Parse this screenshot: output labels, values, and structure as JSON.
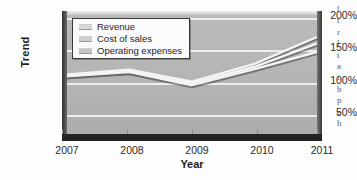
{
  "chart_data": {
    "type": "line",
    "title": "",
    "xlabel": "Year",
    "ylabel": "Trend",
    "categories": [
      "2007",
      "2008",
      "2009",
      "2010",
      "2011"
    ],
    "x": [
      2007,
      2008,
      2009,
      2010,
      2011
    ],
    "ylim": [
      0,
      200
    ],
    "xlim": [
      2007,
      2011
    ],
    "yticks": [
      "50%",
      "100%",
      "150%",
      "200%"
    ],
    "ytick_values": [
      50,
      100,
      150,
      200
    ],
    "grid": true,
    "legend_position": "top-left",
    "series": [
      {
        "name": "Revenue",
        "values": [
          100,
          108,
          88,
          118,
          163
        ]
      },
      {
        "name": "Cost of sales",
        "values": [
          99,
          106,
          85,
          113,
          152
        ]
      },
      {
        "name": "Operating expenses",
        "values": [
          97,
          104,
          82,
          109,
          138
        ]
      }
    ]
  },
  "axes": {
    "y_title": "Trend",
    "x_title": "Year",
    "y_ticks": [
      {
        "label": "200%",
        "value": 200
      },
      {
        "label": "150%",
        "value": 150
      },
      {
        "label": "100%",
        "value": 100
      },
      {
        "label": "50%",
        "value": 50
      }
    ],
    "x_ticks": [
      {
        "label": "2007"
      },
      {
        "label": "2008"
      },
      {
        "label": "2009"
      },
      {
        "label": "2010"
      },
      {
        "label": "2011"
      }
    ]
  },
  "legend": {
    "items": [
      {
        "label": "Revenue",
        "swatch_color": "#d8d8d8"
      },
      {
        "label": "Cost of sales",
        "swatch_color": "#cfcfcf"
      },
      {
        "label": "Operating expenses",
        "swatch_color": "#c4c4c4"
      }
    ]
  },
  "colors": {
    "plot_background": "#b4b4b4",
    "gridline": "#f2f2f2",
    "frame_dark": "#242424",
    "page_background": "#fdfdfd",
    "series_line": "#f4f4f4"
  },
  "side_text": {
    "lines": [
      "l",
      "t",
      "r",
      "l",
      "t",
      "a",
      "t",
      "b",
      "p",
      "e",
      "h"
    ]
  }
}
